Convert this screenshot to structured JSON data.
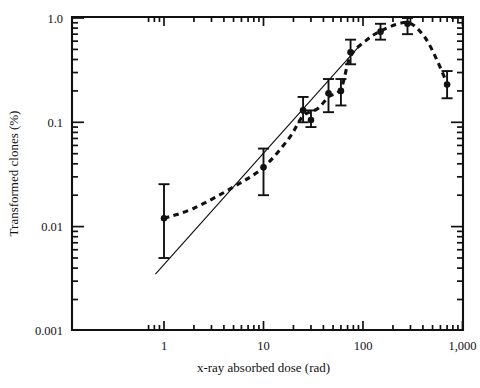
{
  "chart_data": {
    "type": "scatter",
    "title": "",
    "subtitle": "",
    "xlabel": "x-ray absorbed dose (rad)",
    "ylabel": "Transformed clones (%)",
    "xscale": "log",
    "yscale": "log",
    "xlim": [
      0.6,
      1600
    ],
    "ylim": [
      0.001,
      1.0
    ],
    "grid": false,
    "legend": "none",
    "x_tick_labels": [
      "1",
      "10",
      "100",
      "1,000"
    ],
    "x_tick_values": [
      1,
      10,
      100,
      1000
    ],
    "y_tick_labels": [
      "1.0",
      "0.1",
      "0.01",
      "0.001"
    ],
    "y_tick_values": [
      1.0,
      0.1,
      0.01,
      0.001
    ],
    "x_minor_ticks": [
      0.7,
      0.8,
      0.9,
      2,
      3,
      4,
      5,
      6,
      7,
      8,
      9,
      20,
      30,
      40,
      50,
      60,
      70,
      80,
      90,
      200,
      300,
      400,
      500,
      600,
      700,
      800,
      900
    ],
    "y_minor_ticks": [
      0.9,
      0.8,
      0.7,
      0.6,
      0.5,
      0.4,
      0.3,
      0.2,
      0.09,
      0.08,
      0.07,
      0.06,
      0.05,
      0.04,
      0.03,
      0.02,
      0.009,
      0.008,
      0.007,
      0.006,
      0.005,
      0.004,
      0.003,
      0.002
    ],
    "series": [
      {
        "name": "Transformation frequency",
        "style": "markers-with-error-bars-and-dashed-fit",
        "marker": "filled-circle",
        "points": [
          {
            "x": 1,
            "y": 0.012,
            "ylow": 0.005,
            "yhigh": 0.0255
          },
          {
            "x": 10,
            "y": 0.037,
            "ylow": 0.02,
            "yhigh": 0.056
          },
          {
            "x": 25,
            "y": 0.13,
            "ylow": 0.1,
            "yhigh": 0.175
          },
          {
            "x": 30,
            "y": 0.105,
            "ylow": 0.09,
            "yhigh": 0.13
          },
          {
            "x": 45,
            "y": 0.19,
            "ylow": 0.125,
            "yhigh": 0.26
          },
          {
            "x": 60,
            "y": 0.2,
            "ylow": 0.145,
            "yhigh": 0.26
          },
          {
            "x": 75,
            "y": 0.47,
            "ylow": 0.36,
            "yhigh": 0.62
          },
          {
            "x": 150,
            "y": 0.74,
            "ylow": 0.62,
            "yhigh": 0.88
          },
          {
            "x": 280,
            "y": 0.88,
            "ylow": 0.7,
            "yhigh": 1.0
          },
          {
            "x": 700,
            "y": 0.23,
            "ylow": 0.17,
            "yhigh": 0.31
          }
        ]
      }
    ],
    "fitted_curves": [
      {
        "name": "dashed-response-curve",
        "style": "dashed",
        "points": [
          {
            "x": 1,
            "y": 0.012
          },
          {
            "x": 2,
            "y": 0.015
          },
          {
            "x": 5,
            "y": 0.024
          },
          {
            "x": 10,
            "y": 0.037
          },
          {
            "x": 18,
            "y": 0.07
          },
          {
            "x": 25,
            "y": 0.115
          },
          {
            "x": 35,
            "y": 0.135
          },
          {
            "x": 45,
            "y": 0.175
          },
          {
            "x": 60,
            "y": 0.21
          },
          {
            "x": 75,
            "y": 0.43
          },
          {
            "x": 110,
            "y": 0.62
          },
          {
            "x": 150,
            "y": 0.75
          },
          {
            "x": 220,
            "y": 0.87
          },
          {
            "x": 300,
            "y": 0.89
          },
          {
            "x": 420,
            "y": 0.65
          },
          {
            "x": 550,
            "y": 0.4
          },
          {
            "x": 700,
            "y": 0.235
          }
        ]
      },
      {
        "name": "solid-linear-fit",
        "style": "solid",
        "points": [
          {
            "x": 0.82,
            "y": 0.0035
          },
          {
            "x": 95,
            "y": 0.56
          }
        ]
      }
    ]
  },
  "caption": {
    "partial_text": ""
  }
}
